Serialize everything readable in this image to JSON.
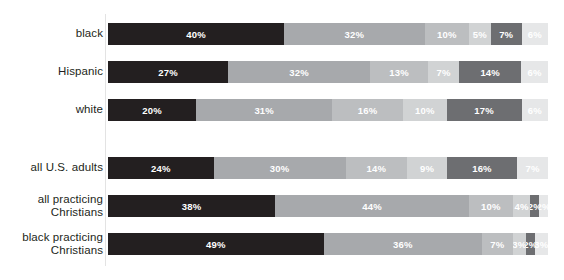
{
  "chart_data": {
    "type": "bar",
    "subtype": "stacked-horizontal-100",
    "title": "",
    "subtitle": "",
    "xlabel": "",
    "ylabel": "",
    "xlim": [
      0,
      100
    ],
    "grid": false,
    "legend": "none",
    "value_suffix": "%",
    "categories": [
      "black",
      "Hispanic",
      "white",
      "all U.S. adults",
      "all practicing\nChristians",
      "black practicing\nChristians"
    ],
    "series": [
      {
        "name": "segment-1",
        "color": "#231f20",
        "values": [
          40,
          27,
          20,
          24,
          38,
          49
        ]
      },
      {
        "name": "segment-2",
        "color": "#a7a9ac",
        "values": [
          32,
          32,
          31,
          30,
          44,
          36
        ]
      },
      {
        "name": "segment-3",
        "color": "#bcbec0",
        "values": [
          10,
          13,
          16,
          14,
          10,
          7
        ]
      },
      {
        "name": "segment-4",
        "color": "#d1d3d4",
        "values": [
          5,
          7,
          10,
          9,
          4,
          3
        ]
      },
      {
        "name": "segment-5",
        "color": "#6d6e71",
        "values": [
          7,
          14,
          17,
          16,
          2,
          2
        ]
      },
      {
        "name": "segment-6",
        "color": "#e6e7e8",
        "values": [
          6,
          6,
          6,
          7,
          2,
          3
        ]
      }
    ],
    "rows": [
      {
        "label": "black",
        "segments": [
          {
            "value": 40,
            "label": "40%",
            "color": "#231f20"
          },
          {
            "value": 32,
            "label": "32%",
            "color": "#a7a9ac"
          },
          {
            "value": 10,
            "label": "10%",
            "color": "#bcbec0"
          },
          {
            "value": 5,
            "label": "5%",
            "color": "#d1d3d4"
          },
          {
            "value": 7,
            "label": "7%",
            "color": "#6d6e71"
          },
          {
            "value": 6,
            "label": "6%",
            "color": "#e6e7e8"
          }
        ]
      },
      {
        "label": "Hispanic",
        "segments": [
          {
            "value": 27,
            "label": "27%",
            "color": "#231f20"
          },
          {
            "value": 32,
            "label": "32%",
            "color": "#a7a9ac"
          },
          {
            "value": 13,
            "label": "13%",
            "color": "#bcbec0"
          },
          {
            "value": 7,
            "label": "7%",
            "color": "#d1d3d4"
          },
          {
            "value": 14,
            "label": "14%",
            "color": "#6d6e71"
          },
          {
            "value": 6,
            "label": "6%",
            "color": "#e6e7e8"
          }
        ]
      },
      {
        "label": "white",
        "segments": [
          {
            "value": 20,
            "label": "20%",
            "color": "#231f20"
          },
          {
            "value": 31,
            "label": "31%",
            "color": "#a7a9ac"
          },
          {
            "value": 16,
            "label": "16%",
            "color": "#bcbec0"
          },
          {
            "value": 10,
            "label": "10%",
            "color": "#d1d3d4"
          },
          {
            "value": 17,
            "label": "17%",
            "color": "#6d6e71"
          },
          {
            "value": 6,
            "label": "6%",
            "color": "#e6e7e8"
          }
        ]
      },
      {
        "label": "all U.S. adults",
        "segments": [
          {
            "value": 24,
            "label": "24%",
            "color": "#231f20"
          },
          {
            "value": 30,
            "label": "30%",
            "color": "#a7a9ac"
          },
          {
            "value": 14,
            "label": "14%",
            "color": "#bcbec0"
          },
          {
            "value": 9,
            "label": "9%",
            "color": "#d1d3d4"
          },
          {
            "value": 16,
            "label": "16%",
            "color": "#6d6e71"
          },
          {
            "value": 7,
            "label": "7%",
            "color": "#e6e7e8"
          }
        ]
      },
      {
        "label": "all practicing\nChristians",
        "segments": [
          {
            "value": 38,
            "label": "38%",
            "color": "#231f20"
          },
          {
            "value": 44,
            "label": "44%",
            "color": "#a7a9ac"
          },
          {
            "value": 10,
            "label": "10%",
            "color": "#bcbec0"
          },
          {
            "value": 4,
            "label": "4%",
            "color": "#d1d3d4"
          },
          {
            "value": 2,
            "label": "2%",
            "color": "#6d6e71"
          },
          {
            "value": 2,
            "label": "2%",
            "color": "#e6e7e8"
          }
        ]
      },
      {
        "label": "black practicing\nChristians",
        "segments": [
          {
            "value": 49,
            "label": "49%",
            "color": "#231f20"
          },
          {
            "value": 36,
            "label": "36%",
            "color": "#a7a9ac"
          },
          {
            "value": 7,
            "label": "7%",
            "color": "#bcbec0"
          },
          {
            "value": 3,
            "label": "3%",
            "color": "#d1d3d4"
          },
          {
            "value": 2,
            "label": "2%",
            "color": "#6d6e71"
          },
          {
            "value": 3,
            "label": "3%",
            "color": "#e6e7e8"
          }
        ]
      }
    ],
    "row_tops": [
      23,
      61,
      99,
      157,
      195,
      233
    ]
  }
}
